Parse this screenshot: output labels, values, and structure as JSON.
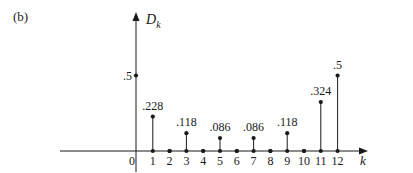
{
  "panel_label": "(b)",
  "chart_data": {
    "type": "stem",
    "title": "",
    "xlabel": "k",
    "ylabel": "D_k",
    "ylabel_main": "D",
    "ylabel_sub": "k",
    "x": [
      0,
      1,
      2,
      3,
      4,
      5,
      6,
      7,
      8,
      9,
      10,
      11,
      12
    ],
    "values": [
      0.5,
      0.228,
      0,
      0.118,
      0,
      0.086,
      0,
      0.086,
      0,
      0.118,
      0,
      0.324,
      0.5
    ],
    "point_labels": [
      ".5",
      ".228",
      "",
      ".118",
      "",
      ".086",
      "",
      ".086",
      "",
      ".118",
      "",
      ".324",
      ".5"
    ],
    "xtick_labels": [
      "0",
      "1",
      "2",
      "3",
      "4",
      "5",
      "6",
      "7",
      "8",
      "9",
      "10",
      "11",
      "12"
    ],
    "ylim": [
      0,
      0.75
    ],
    "grid": false,
    "legend": null
  },
  "colors": {
    "ink": "#1a1a1a",
    "background": "#ffffff"
  }
}
